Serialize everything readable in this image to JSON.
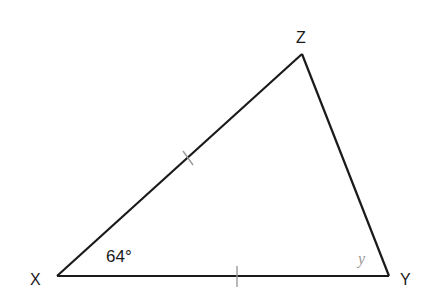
{
  "diagram": {
    "type": "triangle",
    "vertices": [
      {
        "name": "X",
        "label": "X"
      },
      {
        "name": "Y",
        "label": "Y"
      },
      {
        "name": "Z",
        "label": "Z"
      }
    ],
    "angles": {
      "X": "64°",
      "Y": "y"
    },
    "equal_sides": [
      "XZ",
      "XY"
    ],
    "colors": {
      "lines": "#1a1a1a",
      "tick_marks": "#9a9a9a",
      "angle_y_label": "#9a9a9a"
    }
  }
}
